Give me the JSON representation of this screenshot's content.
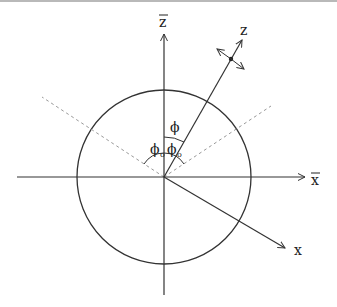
{
  "diagram": {
    "axes": {
      "z_bar": {
        "label": "z",
        "overbar": true
      },
      "x_bar": {
        "label": "x",
        "overbar": true
      },
      "z": {
        "label": "z"
      },
      "x": {
        "label": "x"
      }
    },
    "angles": {
      "phi": {
        "symbol": "ϕ"
      },
      "phi0_left": {
        "symbol": "ϕ",
        "subscript": "o"
      },
      "phi0_right": {
        "symbol": "ϕ",
        "subscript": "o"
      }
    },
    "colors": {
      "stroke": "#333333",
      "dashed": "#999999",
      "top_border": "#b9b9b9"
    }
  }
}
